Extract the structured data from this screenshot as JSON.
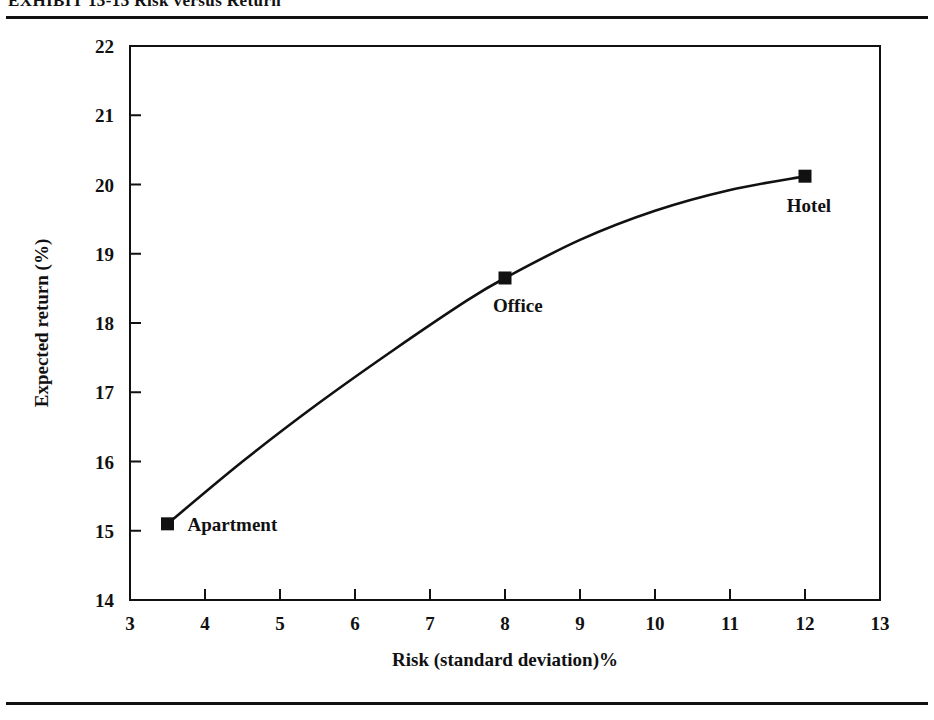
{
  "exhibit": {
    "title": "EXHIBIT 13-13   Risk versus Return"
  },
  "rules": {
    "top_label": "top-divider-rule",
    "bottom_label": "bottom-divider-rule"
  },
  "chart_data": {
    "type": "line",
    "title": "",
    "xlabel": "Risk (standard deviation)%",
    "ylabel": "Expected return (%)",
    "xlim": [
      3,
      13
    ],
    "ylim": [
      14,
      22
    ],
    "xticks": [
      3,
      4,
      5,
      6,
      7,
      8,
      9,
      10,
      11,
      12,
      13
    ],
    "xtick_labels": [
      "3",
      "4",
      "5",
      "6",
      "7",
      "8",
      "9",
      "10",
      "11",
      "12",
      "13"
    ],
    "yticks": [
      14,
      15,
      16,
      17,
      18,
      19,
      20,
      21,
      22
    ],
    "ytick_labels": [
      "14",
      "15",
      "16",
      "17",
      "18",
      "19",
      "20",
      "21",
      "22"
    ],
    "grid": false,
    "legend": "none",
    "marker": "filled-square",
    "line_color": "#111111",
    "marker_color": "#111111",
    "points": [
      {
        "label": "Apartment",
        "x": 3.5,
        "y": 15.1,
        "label_position": "right"
      },
      {
        "label": "Office",
        "x": 8.0,
        "y": 18.65,
        "label_position": "below-right"
      },
      {
        "label": "Hotel",
        "x": 12.0,
        "y": 20.12,
        "label_position": "below-left"
      }
    ],
    "curve_x": [
      3.5,
      4.5,
      5.5,
      6.5,
      7.5,
      8.0,
      9.0,
      10.0,
      11.0,
      12.0
    ],
    "curve_y": [
      15.1,
      16.0,
      16.83,
      17.6,
      18.33,
      18.65,
      19.2,
      19.62,
      19.92,
      20.12
    ]
  }
}
